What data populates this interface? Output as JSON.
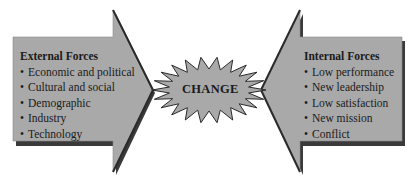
{
  "diagram": {
    "center": {
      "label": "CHANGE",
      "shape": "starburst"
    },
    "external_forces": {
      "title": "External Forces",
      "items": [
        "Economic and political",
        "Cultural and social",
        "Demographic",
        "Industry",
        "Technology"
      ],
      "direction": "right"
    },
    "internal_forces": {
      "title": "Internal Forces",
      "items": [
        "Low performance",
        "New leadership",
        "Low satisfaction",
        "New mission",
        "Conflict"
      ],
      "direction": "left"
    },
    "colors": {
      "fill": "#a9a9a9",
      "outline": "#2a2a2a",
      "shadow": "#333333",
      "background": "#ffffff"
    }
  }
}
